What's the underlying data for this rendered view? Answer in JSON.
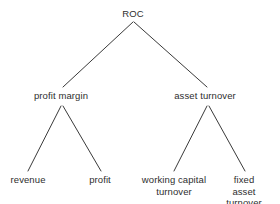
{
  "diagram": {
    "type": "tree",
    "background_color": "#ffffff",
    "line_color": "#3a3a3a",
    "text_color": "#2e2e2e",
    "nodes": {
      "root": {
        "label": "ROC",
        "level": 0
      },
      "profit_margin": {
        "label": "profit margin",
        "level": 1
      },
      "asset_turnover": {
        "label": "asset turnover",
        "level": 1
      },
      "revenue": {
        "label": "revenue",
        "level": 2
      },
      "profit": {
        "label": "profit",
        "level": 2
      },
      "working_capital_turnover": {
        "label": "working capital\nturnover",
        "level": 2
      },
      "fixed_asset_turnover": {
        "label": "fixed asset\nturnover",
        "level": 2
      }
    },
    "edges": [
      {
        "from": "root",
        "to": "profit_margin"
      },
      {
        "from": "root",
        "to": "asset_turnover"
      },
      {
        "from": "profit_margin",
        "to": "revenue"
      },
      {
        "from": "profit_margin",
        "to": "profit"
      },
      {
        "from": "asset_turnover",
        "to": "working_capital_turnover"
      },
      {
        "from": "asset_turnover",
        "to": "fixed_asset_turnover"
      }
    ]
  }
}
